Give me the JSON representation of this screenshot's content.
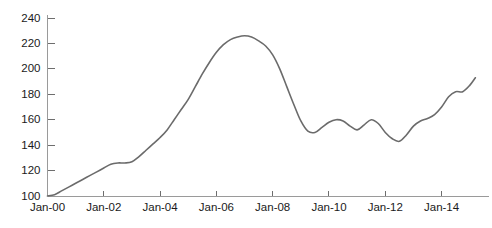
{
  "chart_data": {
    "type": "line",
    "title": "",
    "subtitle": "",
    "xlabel": "",
    "ylabel": "",
    "grid": false,
    "legend": false,
    "legend_position": "none",
    "line_color": "#6b6b6b",
    "axis_color": "#9a9a9a",
    "background_color": "#ffffff",
    "ylim": [
      100,
      240
    ],
    "ytick_labels": [
      "100",
      "120",
      "140",
      "160",
      "180",
      "200",
      "220",
      "240"
    ],
    "ytick_values": [
      100,
      120,
      140,
      160,
      180,
      200,
      220,
      240
    ],
    "xtick_labels": [
      "Jan-00",
      "Jan-02",
      "Jan-04",
      "Jan-06",
      "Jan-08",
      "Jan-10",
      "Jan-12",
      "Jan-14"
    ],
    "xtick_values": [
      2000,
      2002,
      2004,
      2006,
      2008,
      2010,
      2012,
      2014
    ],
    "xlim": [
      2000,
      2015.4
    ],
    "series": [
      {
        "name": "Index",
        "x": [
          2000.0,
          2000.25,
          2000.5,
          2000.75,
          2001.0,
          2001.25,
          2001.5,
          2001.75,
          2002.0,
          2002.25,
          2002.5,
          2002.75,
          2003.0,
          2003.25,
          2003.5,
          2003.75,
          2004.0,
          2004.25,
          2004.5,
          2004.75,
          2005.0,
          2005.25,
          2005.5,
          2005.75,
          2006.0,
          2006.25,
          2006.5,
          2006.75,
          2007.0,
          2007.25,
          2007.5,
          2007.75,
          2008.0,
          2008.25,
          2008.5,
          2008.75,
          2009.0,
          2009.25,
          2009.5,
          2009.75,
          2010.0,
          2010.25,
          2010.5,
          2010.75,
          2011.0,
          2011.25,
          2011.5,
          2011.75,
          2012.0,
          2012.25,
          2012.5,
          2012.75,
          2013.0,
          2013.25,
          2013.5,
          2013.75,
          2014.0,
          2014.25,
          2014.5,
          2014.75,
          2015.0,
          2015.2
        ],
        "values": [
          100,
          101,
          104,
          107,
          110,
          113,
          116,
          119,
          122,
          125,
          126,
          126,
          127,
          131,
          136,
          141,
          146,
          152,
          160,
          168,
          176,
          186,
          196,
          205,
          213,
          219,
          223,
          225,
          226,
          225,
          222,
          218,
          211,
          200,
          186,
          172,
          159,
          151,
          150,
          154,
          158,
          160,
          159,
          155,
          152,
          156,
          160,
          157,
          150,
          145,
          143,
          148,
          155,
          159,
          161,
          164,
          170,
          178,
          182,
          182,
          187,
          193
        ]
      }
    ],
    "annotations": [],
    "peak": {
      "x": 2007.0,
      "value": 226
    },
    "trough_post_peak": {
      "x": 2009.5,
      "value": 150
    },
    "trough_2012": {
      "x": 2012.5,
      "value": 143
    },
    "end_value": 193,
    "start_value": 100
  }
}
